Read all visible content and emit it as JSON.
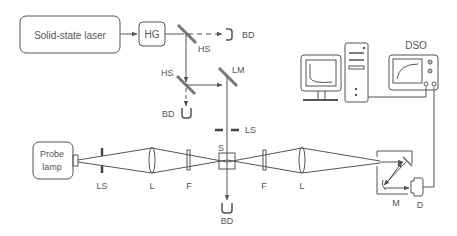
{
  "labels": {
    "laser": "Solid-state laser",
    "hg": "HG",
    "hs1": "HS",
    "bd1": "BD",
    "hs2": "HS",
    "lm": "LM",
    "bd2": "BD",
    "ls_vert": "LS",
    "probe_line1": "Probe",
    "probe_line2": "lamp",
    "ls_horiz": "LS",
    "l1": "L",
    "f1": "F",
    "s": "S",
    "f2": "F",
    "l2": "L",
    "bd3": "BD",
    "m": "M",
    "d": "D",
    "dso": "DSO"
  }
}
